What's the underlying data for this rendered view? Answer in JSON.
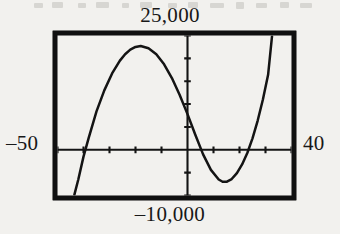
{
  "figure": {
    "kind": "graphing-calculator-viewing-window",
    "labels": {
      "top": "25,000",
      "bottom": "–10,000",
      "left": "–50",
      "right": "40"
    },
    "colors": {
      "ink": "#141414",
      "paper": "#f2f1ee",
      "frame": "#101010"
    }
  },
  "chart_data": {
    "type": "line",
    "title": "",
    "subtitle": "",
    "xlabel": "",
    "ylabel": "",
    "xlim": [
      -50,
      40
    ],
    "ylim": [
      -10000,
      25000
    ],
    "xtick_labels": [
      "–50",
      "40"
    ],
    "ytick_labels": [
      "25,000",
      "–10,000"
    ],
    "grid": false,
    "legend": null,
    "axes": {
      "x_axis_drawn": true,
      "y_axis_drawn": true,
      "x_tick_count": 8,
      "y_tick_count": 6,
      "x_tick_spacing": 10,
      "y_tick_spacing": 5000
    },
    "series": [
      {
        "name": "cubic",
        "x": [
          -43.5,
          -42,
          -40,
          -38,
          -35,
          -32,
          -29,
          -26,
          -24,
          -22,
          -20,
          -18,
          -15,
          -12,
          -9,
          -6,
          -3,
          0,
          3,
          6,
          9,
          12,
          13.5,
          15,
          17,
          19,
          21,
          23,
          25,
          27,
          29,
          31,
          32.5
        ],
        "y": [
          -9800,
          -6500,
          -1500,
          2600,
          8400,
          13000,
          16700,
          19500,
          20900,
          21900,
          22500,
          22700,
          22200,
          20900,
          18700,
          15700,
          12000,
          7800,
          3300,
          -1000,
          -4400,
          -6500,
          -7000,
          -7000,
          -6400,
          -5100,
          -3200,
          -700,
          2500,
          6400,
          11000,
          16400,
          24800
        ]
      }
    ],
    "features": {
      "left_x_intercept": -39.2,
      "local_maximum": {
        "x": -17.5,
        "y": 22700
      },
      "middle_x_intercept": 4.8,
      "local_minimum": {
        "x": 14.3,
        "y": -7050
      },
      "right_x_intercept": 26.0,
      "exits_top_at_x": 32.9
    }
  }
}
